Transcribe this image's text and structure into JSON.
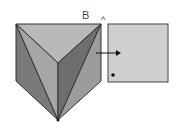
{
  "diagram": {
    "label_b": "B",
    "caret": "^",
    "colors": {
      "top_face": "#b9b9b9",
      "left_dark": "#7a7a7a",
      "left_mid": "#a6a6a6",
      "right_dark": "#6e6e6e",
      "right_mid": "#9c9c9c",
      "square": "#cfcfcf",
      "stroke": "#333333"
    }
  }
}
